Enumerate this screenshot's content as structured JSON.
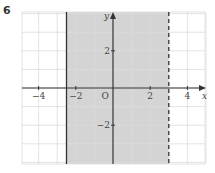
{
  "question_number": "6",
  "graph": {
    "x_label": "x",
    "y_label": "y",
    "origin_label": "O",
    "x_ticks": [
      {
        "v": -4,
        "label": "−4"
      },
      {
        "v": -2,
        "label": "−2"
      },
      {
        "v": 2,
        "label": "2"
      },
      {
        "v": 4,
        "label": "4"
      }
    ],
    "y_ticks": [
      {
        "v": 2,
        "label": "2"
      },
      {
        "v": -2,
        "label": "−2"
      }
    ],
    "xlim": [
      -5,
      5
    ],
    "ylim": [
      -4,
      4
    ],
    "solid_line_x": -2.5,
    "dashed_line_x": 3,
    "shaded_region": "-2.5 <= x < 3",
    "shade_color": "#d4d4d4",
    "grid_color": "#dcdcdc",
    "line_color": "#333333"
  }
}
